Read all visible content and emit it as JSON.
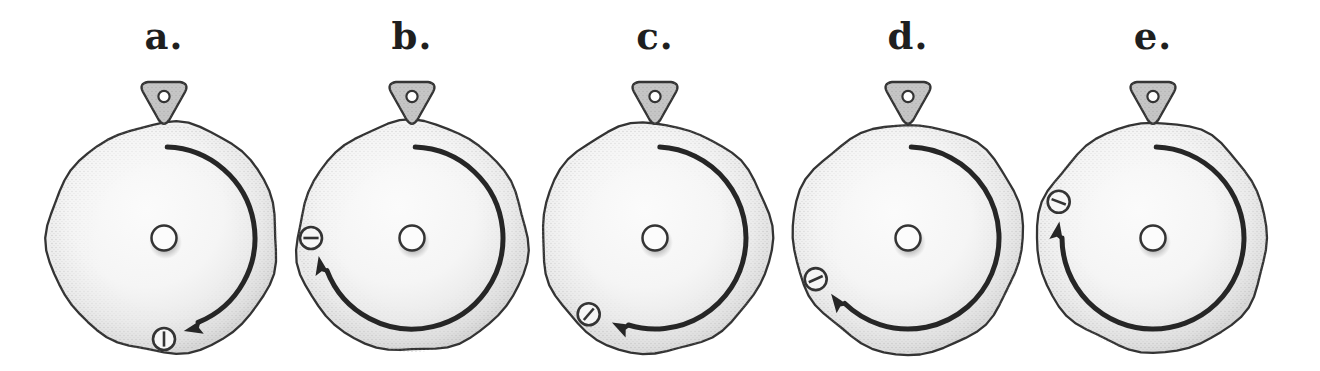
{
  "figure": {
    "type": "dial-rotation-diagram",
    "background": "#ffffff",
    "ink": "#343434",
    "arc_color": "#262626",
    "label_color": "#1f1f1f",
    "disc_fill_center": "#fbfbfb",
    "disc_fill_edge": "#d4d4d4",
    "pointer_fill": "#c6c6c6",
    "marker_fill": "#f6f6f6",
    "hub_fill": "#fcfcfc",
    "rotation_direction": "clockwise",
    "angle_reference": "degrees clockwise from the top pointer",
    "dials": [
      {
        "label": "a.",
        "arc_start_deg": 2,
        "arc_end_deg": 168,
        "marker_angle_deg": 180
      },
      {
        "label": "b.",
        "arc_start_deg": 2,
        "arc_end_deg": 259,
        "marker_angle_deg": 270
      },
      {
        "label": "c.",
        "arc_start_deg": 3,
        "arc_end_deg": 207,
        "marker_angle_deg": 221
      },
      {
        "label": "d.",
        "arc_start_deg": 2,
        "arc_end_deg": 234,
        "marker_angle_deg": 246
      },
      {
        "label": "e.",
        "arc_start_deg": 2,
        "arc_end_deg": 280,
        "marker_angle_deg": 291
      }
    ]
  }
}
